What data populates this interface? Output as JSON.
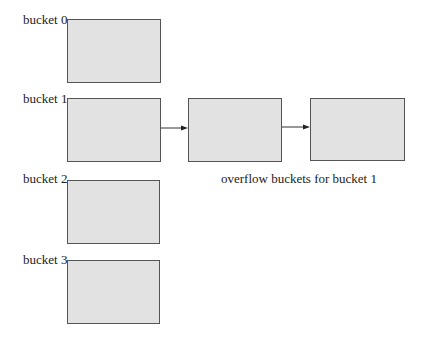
{
  "diagram": {
    "buckets": [
      {
        "label": "bucket 0"
      },
      {
        "label": "bucket 1"
      },
      {
        "label": "bucket 2"
      },
      {
        "label": "bucket 3"
      }
    ],
    "overflow_buckets": [
      {
        "label": ""
      },
      {
        "label": ""
      }
    ],
    "caption": "overflow  buckets for bucket 1",
    "colors": {
      "box_fill": "#e2e2e2",
      "box_border": "#555555",
      "arrow": "#333333"
    }
  }
}
